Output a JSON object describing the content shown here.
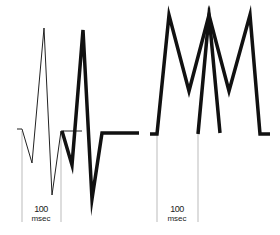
{
  "figure": {
    "left_panel": {
      "thin_waveform": [
        [
          17,
          129
        ],
        [
          22,
          129
        ],
        [
          32,
          163
        ],
        [
          44,
          28
        ],
        [
          52,
          195
        ],
        [
          61,
          131
        ]
      ],
      "thin_tail": [
        [
          61,
          131
        ],
        [
          82,
          131
        ]
      ],
      "thick_waveform": [
        [
          62,
          131
        ],
        [
          72,
          165
        ],
        [
          83,
          30
        ],
        [
          92,
          199
        ],
        [
          102,
          133
        ],
        [
          139,
          133
        ]
      ],
      "marker_lines_x": [
        22,
        61
      ],
      "marker_top_y": 131,
      "marker_bottom_y": 222,
      "scale_label_number": "100",
      "scale_label_unit": "msec"
    },
    "right_panel": {
      "waveform_a": [
        [
          150,
          134
        ],
        [
          157,
          134
        ],
        [
          169,
          15
        ],
        [
          189,
          91
        ],
        [
          209,
          15
        ],
        [
          220,
          133
        ]
      ],
      "waveform_b": [
        [
          198,
          134
        ],
        [
          209,
          15
        ],
        [
          229,
          91
        ],
        [
          250,
          15
        ],
        [
          260,
          134
        ],
        [
          270,
          134
        ]
      ],
      "marker_lines_x": [
        157,
        198
      ],
      "marker_top_y": 134,
      "marker_bottom_y": 222,
      "scale_label_number": "100",
      "scale_label_unit": "msec"
    },
    "colors": {
      "line": "#111111",
      "marker": "#aaaaaa"
    }
  }
}
